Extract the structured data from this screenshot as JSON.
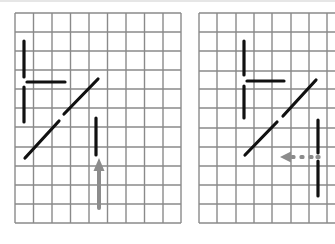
{
  "canvas": {
    "width": 335,
    "height": 244,
    "background": "#ffffff"
  },
  "colors": {
    "grid": "#8a8a8a",
    "stroke": "#111111",
    "arrow": "#8c8c8c"
  },
  "panels": [
    {
      "id": "left",
      "grid": {
        "x_lines": [
          15,
          33.5,
          52,
          70.5,
          89,
          107.5,
          126,
          144.5,
          163,
          181
        ],
        "y_lines": [
          13,
          32,
          51,
          70,
          89,
          108,
          127,
          147,
          166,
          185,
          204,
          223
        ]
      },
      "segments": [
        {
          "name": "l-shape-upper-vertical",
          "x1": 24,
          "y1": 41,
          "x2": 24,
          "y2": 77
        },
        {
          "name": "l-shape-horizontal-bar",
          "x1": 27,
          "y1": 82,
          "x2": 65,
          "y2": 82
        },
        {
          "name": "l-shape-lower-vertical",
          "x1": 24,
          "y1": 87,
          "x2": 24,
          "y2": 122
        },
        {
          "name": "diagonal-upper-part",
          "x1": 64,
          "y1": 114,
          "x2": 98,
          "y2": 79
        },
        {
          "name": "diagonal-lower-part",
          "x1": 25,
          "y1": 158,
          "x2": 59,
          "y2": 121
        },
        {
          "name": "short-vertical-bar",
          "x1": 96,
          "y1": 118,
          "x2": 96,
          "y2": 155
        }
      ],
      "arrows": [
        {
          "name": "up-arrow",
          "style": "solid",
          "direction": "up",
          "tip_x": 99,
          "tip_y": 158,
          "tail_x": 99,
          "tail_y": 208,
          "head_w": 11,
          "head_l": 13,
          "shaft_w": 4
        }
      ]
    },
    {
      "id": "right",
      "grid": {
        "x_lines": [
          199,
          217,
          236,
          254,
          272,
          291,
          309,
          327
        ],
        "y_lines": [
          13,
          32,
          51,
          71,
          89,
          108,
          128,
          147,
          166,
          185,
          204,
          223
        ],
        "open_right": true
      },
      "segments": [
        {
          "name": "l-shape-upper-vertical",
          "x1": 244,
          "y1": 41,
          "x2": 244,
          "y2": 75
        },
        {
          "name": "l-shape-horizontal-bar",
          "x1": 247,
          "y1": 81,
          "x2": 284,
          "y2": 81
        },
        {
          "name": "l-shape-lower-vertical",
          "x1": 244,
          "y1": 86,
          "x2": 244,
          "y2": 118
        },
        {
          "name": "diagonal-upper-part",
          "x1": 283,
          "y1": 116,
          "x2": 316,
          "y2": 80
        },
        {
          "name": "diagonal-lower-part",
          "x1": 245,
          "y1": 155,
          "x2": 277,
          "y2": 122
        },
        {
          "name": "long-vertical-upper-part",
          "x1": 318,
          "y1": 120,
          "x2": 318,
          "y2": 153
        },
        {
          "name": "long-vertical-lower-part",
          "x1": 318,
          "y1": 161,
          "x2": 318,
          "y2": 196
        }
      ],
      "arrows": [
        {
          "name": "left-dashed-arrow",
          "style": "dashed",
          "direction": "left",
          "tip_x": 280,
          "tip_y": 157,
          "tail_x": 321,
          "tail_y": 157,
          "head_w": 11,
          "head_l": 11,
          "shaft_w": 4,
          "dots": [
            293,
            302,
            311,
            318
          ]
        }
      ]
    }
  ]
}
